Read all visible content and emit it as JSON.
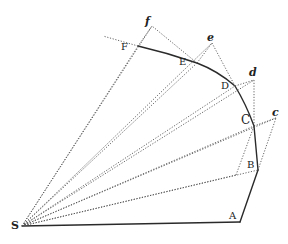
{
  "figure": {
    "labels": {
      "S": "S",
      "A": "A",
      "B": "B",
      "C": "C",
      "D": "D",
      "E": "E",
      "F": "F",
      "c": "c",
      "d": "d",
      "e": "e",
      "f": "f"
    },
    "points": {
      "S": [
        22,
        226
      ],
      "A": [
        240,
        222
      ],
      "B": [
        258,
        170
      ],
      "C": [
        254,
        126
      ],
      "D": [
        235,
        86
      ],
      "E": [
        197,
        63
      ],
      "F": [
        138,
        46
      ],
      "c": [
        276,
        118
      ],
      "d": [
        254,
        80
      ],
      "e": [
        212,
        43
      ],
      "f": [
        152,
        26
      ],
      "b_prime": [
        236,
        175
      ],
      "F_ext": [
        103,
        36
      ]
    }
  }
}
